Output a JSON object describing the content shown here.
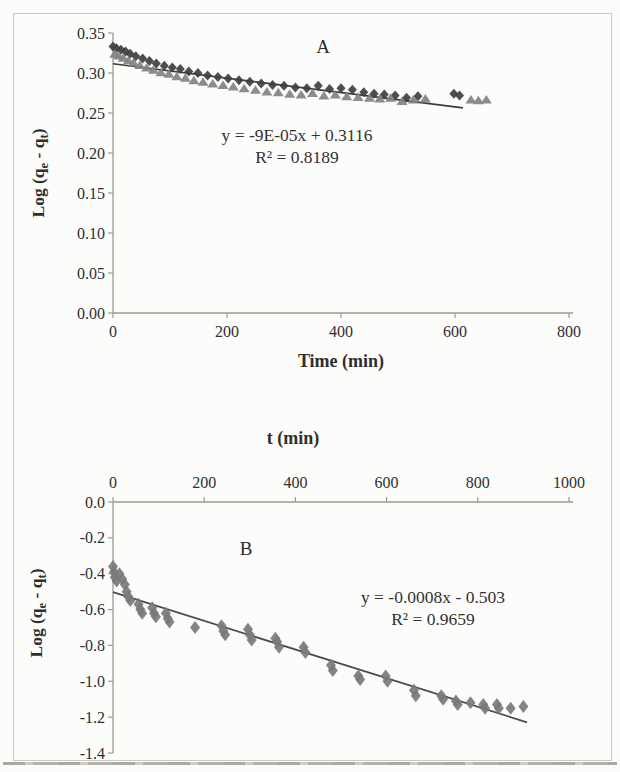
{
  "figure": {
    "background": "#fcfcfa",
    "border_color": "#c9c9c2",
    "text_color": "#2f2f2f",
    "axis_color": "#9b9b95"
  },
  "chart_data": [
    {
      "id": "panel-a",
      "type": "scatter",
      "panel_label": "A",
      "xlabel": "Time (min)",
      "ylabel_parts": [
        "Log (q",
        "e",
        " - q",
        "t",
        ")"
      ],
      "xlim": [
        0,
        800
      ],
      "ylim": [
        0,
        0.35
      ],
      "x_axis_position": "bottom",
      "grid": false,
      "legend": "none",
      "xtick_values": [
        0,
        200,
        400,
        600,
        800
      ],
      "xtick_labels": [
        "0",
        "200",
        "400",
        "600",
        "800"
      ],
      "ytick_values": [
        0,
        0.05,
        0.1,
        0.15,
        0.2,
        0.25,
        0.3,
        0.35
      ],
      "ytick_labels": [
        "0.00",
        "0.05",
        "0.10",
        "0.15",
        "0.20",
        "0.25",
        "0.30",
        "0.35"
      ],
      "annotation": {
        "line1": "y = -9E-05x + 0.3116",
        "line2": "R² = 0.8189"
      },
      "trendline": {
        "x": [
          0,
          614
        ],
        "y": [
          0.3116,
          0.2563
        ],
        "color": "#3c3c3c"
      },
      "series": [
        {
          "name": "diamond-series",
          "marker": "diamond",
          "color": "#3f3f3f",
          "points": [
            [
              0,
              0.333
            ],
            [
              6,
              0.331
            ],
            [
              14,
              0.329
            ],
            [
              22,
              0.327
            ],
            [
              30,
              0.324
            ],
            [
              40,
              0.321
            ],
            [
              52,
              0.318
            ],
            [
              64,
              0.315
            ],
            [
              76,
              0.312
            ],
            [
              90,
              0.309
            ],
            [
              104,
              0.307
            ],
            [
              118,
              0.305
            ],
            [
              133,
              0.302
            ],
            [
              149,
              0.3
            ],
            [
              166,
              0.297
            ],
            [
              184,
              0.295
            ],
            [
              202,
              0.293
            ],
            [
              221,
              0.291
            ],
            [
              240,
              0.289
            ],
            [
              260,
              0.287
            ],
            [
              280,
              0.285
            ],
            [
              300,
              0.284
            ],
            [
              320,
              0.282
            ],
            [
              340,
              0.281
            ],
            [
              360,
              0.284
            ],
            [
              380,
              0.28
            ],
            [
              400,
              0.281
            ],
            [
              420,
              0.279
            ],
            [
              440,
              0.276
            ],
            [
              458,
              0.274
            ],
            [
              476,
              0.273
            ],
            [
              495,
              0.272
            ],
            [
              515,
              0.269
            ],
            [
              535,
              0.271
            ],
            [
              598,
              0.274
            ],
            [
              608,
              0.272
            ]
          ]
        },
        {
          "name": "triangle-series",
          "marker": "triangle",
          "color": "#828282",
          "points": [
            [
              3,
              0.324
            ],
            [
              10,
              0.322
            ],
            [
              18,
              0.319
            ],
            [
              27,
              0.316
            ],
            [
              36,
              0.313
            ],
            [
              47,
              0.31
            ],
            [
              59,
              0.307
            ],
            [
              71,
              0.304
            ],
            [
              84,
              0.301
            ],
            [
              98,
              0.299
            ],
            [
              112,
              0.296
            ],
            [
              127,
              0.294
            ],
            [
              142,
              0.291
            ],
            [
              158,
              0.289
            ],
            [
              175,
              0.287
            ],
            [
              193,
              0.285
            ],
            [
              211,
              0.283
            ],
            [
              230,
              0.281
            ],
            [
              250,
              0.279
            ],
            [
              270,
              0.277
            ],
            [
              290,
              0.276
            ],
            [
              310,
              0.274
            ],
            [
              330,
              0.273
            ],
            [
              350,
              0.275
            ],
            [
              370,
              0.272
            ],
            [
              390,
              0.273
            ],
            [
              410,
              0.271
            ],
            [
              430,
              0.27
            ],
            [
              450,
              0.269
            ],
            [
              468,
              0.268
            ],
            [
              487,
              0.269
            ],
            [
              507,
              0.265
            ],
            [
              527,
              0.267
            ],
            [
              548,
              0.268
            ],
            [
              628,
              0.267
            ],
            [
              641,
              0.266
            ],
            [
              655,
              0.267
            ]
          ]
        }
      ]
    },
    {
      "id": "panel-b",
      "type": "scatter",
      "panel_label": "B",
      "xlabel": "t (min)",
      "ylabel_parts": [
        "Log (q",
        "e",
        " - q",
        "t",
        ")"
      ],
      "xlim": [
        0,
        1000
      ],
      "ylim": [
        -1.4,
        0
      ],
      "x_axis_position": "top",
      "grid": false,
      "legend": "none",
      "xtick_values": [
        0,
        200,
        400,
        600,
        800,
        1000
      ],
      "xtick_labels": [
        "0",
        "200",
        "400",
        "600",
        "800",
        "1000"
      ],
      "ytick_values": [
        0,
        -0.2,
        -0.4,
        -0.6,
        -0.8,
        -1.0,
        -1.2,
        -1.4
      ],
      "ytick_labels": [
        "0.0",
        "-0.2",
        "-0.4",
        "-0.6",
        "-0.8",
        "-1.0",
        "-1.2",
        "-1.4"
      ],
      "annotation": {
        "line1": "y = -0.0008x - 0.503",
        "line2": "R² = 0.9659"
      },
      "trendline": {
        "x": [
          0,
          908
        ],
        "y": [
          -0.503,
          -1.229
        ],
        "color": "#4a4a4a"
      },
      "series": [
        {
          "name": "diamond-series",
          "marker": "diamond",
          "color": "#7a7a7a",
          "points": [
            [
              0,
              -0.36
            ],
            [
              2,
              -0.39
            ],
            [
              4,
              -0.42
            ],
            [
              8,
              -0.44
            ],
            [
              14,
              -0.4
            ],
            [
              20,
              -0.43
            ],
            [
              26,
              -0.46
            ],
            [
              30,
              -0.5
            ],
            [
              34,
              -0.53
            ],
            [
              38,
              -0.55
            ],
            [
              56,
              -0.57
            ],
            [
              60,
              -0.6
            ],
            [
              64,
              -0.62
            ],
            [
              86,
              -0.59
            ],
            [
              90,
              -0.62
            ],
            [
              94,
              -0.64
            ],
            [
              116,
              -0.62
            ],
            [
              120,
              -0.65
            ],
            [
              124,
              -0.67
            ],
            [
              180,
              -0.7
            ],
            [
              238,
              -0.69
            ],
            [
              242,
              -0.72
            ],
            [
              246,
              -0.74
            ],
            [
              296,
              -0.71
            ],
            [
              300,
              -0.74
            ],
            [
              304,
              -0.77
            ],
            [
              356,
              -0.76
            ],
            [
              360,
              -0.78
            ],
            [
              364,
              -0.81
            ],
            [
              418,
              -0.81
            ],
            [
              422,
              -0.84
            ],
            [
              478,
              -0.91
            ],
            [
              482,
              -0.94
            ],
            [
              538,
              -0.97
            ],
            [
              542,
              -0.99
            ],
            [
              598,
              -0.97
            ],
            [
              602,
              -1.0
            ],
            [
              660,
              -1.05
            ],
            [
              664,
              -1.08
            ],
            [
              720,
              -1.08
            ],
            [
              724,
              -1.1
            ],
            [
              752,
              -1.11
            ],
            [
              756,
              -1.13
            ],
            [
              784,
              -1.12
            ],
            [
              812,
              -1.13
            ],
            [
              816,
              -1.15
            ],
            [
              842,
              -1.13
            ],
            [
              846,
              -1.15
            ],
            [
              872,
              -1.15
            ],
            [
              900,
              -1.14
            ]
          ]
        }
      ]
    }
  ]
}
